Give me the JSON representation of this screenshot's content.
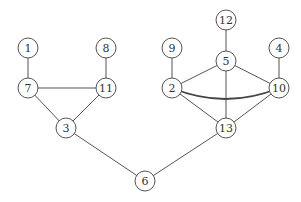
{
  "graph": {
    "node_radius": 10,
    "nodes": [
      {
        "id": "1",
        "label": "1",
        "x": 28,
        "y": 48
      },
      {
        "id": "8",
        "label": "8",
        "x": 106,
        "y": 48
      },
      {
        "id": "7",
        "label": "7",
        "x": 28,
        "y": 88
      },
      {
        "id": "11",
        "label": "11",
        "x": 106,
        "y": 88
      },
      {
        "id": "3",
        "label": "3",
        "x": 66,
        "y": 128
      },
      {
        "id": "12",
        "label": "12",
        "x": 226,
        "y": 20
      },
      {
        "id": "9",
        "label": "9",
        "x": 172,
        "y": 48
      },
      {
        "id": "5",
        "label": "5",
        "x": 226,
        "y": 61
      },
      {
        "id": "4",
        "label": "4",
        "x": 279,
        "y": 48
      },
      {
        "id": "2",
        "label": "2",
        "x": 172,
        "y": 88
      },
      {
        "id": "10",
        "label": "10",
        "x": 279,
        "y": 88
      },
      {
        "id": "13",
        "label": "13",
        "x": 226,
        "y": 128
      },
      {
        "id": "6",
        "label": "6",
        "x": 145,
        "y": 181
      }
    ],
    "edges": [
      {
        "from": "1",
        "to": "7"
      },
      {
        "from": "8",
        "to": "11"
      },
      {
        "from": "7",
        "to": "11"
      },
      {
        "from": "7",
        "to": "3"
      },
      {
        "from": "11",
        "to": "3"
      },
      {
        "from": "3",
        "to": "6"
      },
      {
        "from": "12",
        "to": "5"
      },
      {
        "from": "9",
        "to": "2"
      },
      {
        "from": "4",
        "to": "10"
      },
      {
        "from": "5",
        "to": "2"
      },
      {
        "from": "5",
        "to": "10"
      },
      {
        "from": "5",
        "to": "13"
      },
      {
        "from": "2",
        "to": "10",
        "curved": true
      },
      {
        "from": "2",
        "to": "13"
      },
      {
        "from": "10",
        "to": "13"
      },
      {
        "from": "13",
        "to": "6"
      }
    ]
  }
}
